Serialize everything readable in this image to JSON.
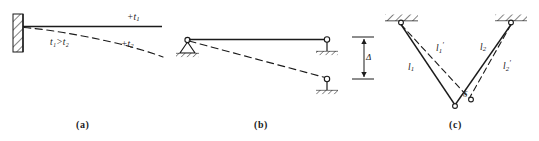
{
  "figure": {
    "type": "structural-engineering-diagram",
    "background_color": "#ffffff",
    "ink_color": "#1b1b1b",
    "width": 539,
    "height": 141,
    "panels": [
      {
        "id": "a",
        "caption": "(a)",
        "description": "Cantilever beam fixed at left wall, deflected shape shown dashed due to temperature gradient",
        "support_type": "fixed-wall",
        "labels": [
          {
            "name": "top-temperature",
            "base": "+t",
            "sub": "1",
            "prime": ""
          },
          {
            "name": "bottom-temperature",
            "base": "+t",
            "sub": "2",
            "prime": ""
          },
          {
            "name": "temperature-inequality",
            "text": "t₁>t₂"
          }
        ]
      },
      {
        "id": "b",
        "caption": "(b)",
        "description": "Simply supported beam, pin at left, roller link at right; right support settles by delta, deflected shape dashed",
        "support_type": "pin-and-roller",
        "labels": [
          {
            "name": "settlement-dimension",
            "text": "Δ"
          }
        ]
      },
      {
        "id": "c",
        "caption": "(c)",
        "description": "Two-bar pin-jointed truss suspended from ceiling; original members l1 and l2 solid, elongated members l1-prime and l2-prime dashed, joint displaces by delta",
        "support_type": "ceiling-hatched-pins",
        "labels": [
          {
            "name": "member-1",
            "base": "l",
            "sub": "1",
            "prime": ""
          },
          {
            "name": "member-1-prime",
            "base": "l",
            "sub": "1",
            "prime": "′"
          },
          {
            "name": "member-2",
            "base": "l",
            "sub": "2",
            "prime": ""
          },
          {
            "name": "member-2-prime",
            "base": "l",
            "sub": "2",
            "prime": "′"
          },
          {
            "name": "joint-displacement",
            "text": "δ"
          }
        ]
      }
    ]
  },
  "panel_a": {
    "caption": "(a)",
    "label_t1": "+t",
    "label_t1_sub": "1",
    "label_t2": "+t",
    "label_t2_sub": "2",
    "label_inequality": "t₁>t₂"
  },
  "panel_b": {
    "caption": "(b)",
    "label_delta": "Δ"
  },
  "panel_c": {
    "caption": "(c)",
    "label_l1": "l",
    "label_l1_sub": "1",
    "label_l1p": "l",
    "label_l1p_sub": "1",
    "label_l1p_prime": "′",
    "label_l2": "l",
    "label_l2_sub": "2",
    "label_l2p": "l",
    "label_l2p_sub": "2",
    "label_l2p_prime": "′",
    "label_delta": "δ"
  }
}
